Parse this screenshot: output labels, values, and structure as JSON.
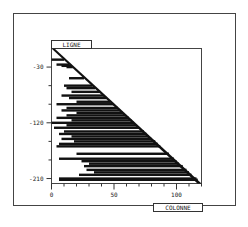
{
  "chart_data": {
    "type": "bar",
    "orientation": "horizontal",
    "title": "",
    "ylabel": "LIGNE",
    "xlabel": "COLONNE",
    "xlim": [
      0,
      120
    ],
    "ylim": [
      0,
      -218
    ],
    "x_ticks": [
      0,
      50,
      100
    ],
    "x_tick_labels": [
      "0",
      "50",
      "100"
    ],
    "y_ticks": [
      -30,
      -120,
      -210
    ],
    "y_tick_labels": [
      "-30",
      "-120",
      "-210"
    ],
    "grid": false,
    "legend": null,
    "bars": [
      {
        "line": -18,
        "start": 0,
        "end": 10
      },
      {
        "line": -26,
        "start": 4,
        "end": 14
      },
      {
        "line": -28,
        "start": 8,
        "end": 16
      },
      {
        "line": -30,
        "start": 12,
        "end": 17
      },
      {
        "line": -48,
        "start": 14,
        "end": 26
      },
      {
        "line": -60,
        "start": 10,
        "end": 33
      },
      {
        "line": -64,
        "start": 12,
        "end": 35
      },
      {
        "line": -70,
        "start": 16,
        "end": 39
      },
      {
        "line": -76,
        "start": 8,
        "end": 42
      },
      {
        "line": -80,
        "start": 14,
        "end": 44
      },
      {
        "line": -86,
        "start": 20,
        "end": 47
      },
      {
        "line": -90,
        "start": 4,
        "end": 50
      },
      {
        "line": -96,
        "start": 12,
        "end": 53
      },
      {
        "line": -100,
        "start": 8,
        "end": 55
      },
      {
        "line": -104,
        "start": 20,
        "end": 57
      },
      {
        "line": -108,
        "start": 12,
        "end": 59
      },
      {
        "line": -112,
        "start": 4,
        "end": 62
      },
      {
        "line": -116,
        "start": 16,
        "end": 64
      },
      {
        "line": -120,
        "start": 0,
        "end": 66
      },
      {
        "line": -124,
        "start": 12,
        "end": 68
      },
      {
        "line": -128,
        "start": 2,
        "end": 70
      },
      {
        "line": -134,
        "start": 10,
        "end": 74
      },
      {
        "line": -138,
        "start": 6,
        "end": 76
      },
      {
        "line": -142,
        "start": 16,
        "end": 78
      },
      {
        "line": -146,
        "start": 8,
        "end": 80
      },
      {
        "line": -150,
        "start": 18,
        "end": 83
      },
      {
        "line": -154,
        "start": 6,
        "end": 85
      },
      {
        "line": -158,
        "start": 4,
        "end": 87
      },
      {
        "line": -170,
        "start": 20,
        "end": 94
      },
      {
        "line": -178,
        "start": 6,
        "end": 98
      },
      {
        "line": -182,
        "start": 24,
        "end": 100
      },
      {
        "line": -186,
        "start": 30,
        "end": 102
      },
      {
        "line": -190,
        "start": 26,
        "end": 105
      },
      {
        "line": -196,
        "start": 28,
        "end": 108
      },
      {
        "line": -200,
        "start": 34,
        "end": 110
      },
      {
        "line": -204,
        "start": 22,
        "end": 112
      },
      {
        "line": -210,
        "start": 6,
        "end": 116
      },
      {
        "line": -212,
        "start": 6,
        "end": 117
      }
    ]
  },
  "labels": {
    "ligne": "LIGNE",
    "colonne": "COLONNE"
  },
  "colors": {
    "ink": "#111111",
    "frame": "#444444",
    "background": "#ffffff"
  }
}
